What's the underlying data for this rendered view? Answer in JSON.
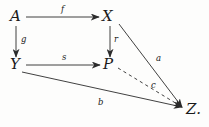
{
  "diagram": {
    "kind": "commutative-diagram",
    "background_color": "#fdfdfc",
    "stroke_color": "#2b2b2b",
    "text_color": "#1a1a1a",
    "nodes": [
      {
        "id": "A",
        "label": "A",
        "x": 15,
        "y": 17
      },
      {
        "id": "X",
        "label": "X",
        "x": 108,
        "y": 17
      },
      {
        "id": "Y",
        "label": "Y",
        "x": 15,
        "y": 65
      },
      {
        "id": "P",
        "label": "P",
        "x": 109,
        "y": 65
      },
      {
        "id": "Z",
        "label": "Z.",
        "x": 192,
        "y": 110
      }
    ],
    "edges": [
      {
        "id": "f",
        "label": "f",
        "from": "A",
        "to": "X",
        "style": "solid",
        "label_x": 63,
        "label_y": 8
      },
      {
        "id": "g",
        "label": "g",
        "from": "A",
        "to": "Y",
        "style": "solid",
        "label_x": 22,
        "label_y": 39
      },
      {
        "id": "r",
        "label": "r",
        "from": "X",
        "to": "P",
        "style": "solid",
        "label_x": 115,
        "label_y": 39
      },
      {
        "id": "s",
        "label": "s",
        "from": "Y",
        "to": "P",
        "style": "solid",
        "label_x": 63,
        "label_y": 56
      },
      {
        "id": "a",
        "label": "a",
        "from": "X",
        "to": "Z",
        "style": "solid",
        "label_x": 157,
        "label_y": 58
      },
      {
        "id": "c",
        "label": "c",
        "from": "P",
        "to": "Z",
        "style": "dashed",
        "label_x": 152,
        "label_y": 85
      },
      {
        "id": "b",
        "label": "b",
        "from": "Y",
        "to": "Z",
        "style": "solid",
        "label_x": 99,
        "label_y": 101
      }
    ]
  }
}
